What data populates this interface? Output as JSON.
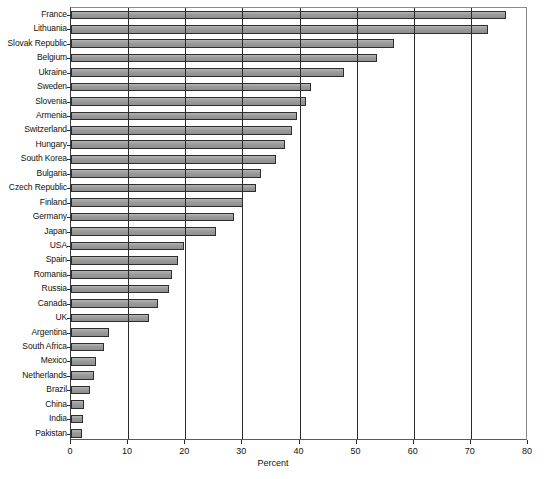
{
  "chart_data": {
    "type": "bar",
    "orientation": "horizontal",
    "title": "",
    "xlabel": "Percent",
    "ylabel": "",
    "xlim": [
      0,
      80
    ],
    "xticks": [
      0,
      10,
      20,
      30,
      40,
      50,
      60,
      70,
      80
    ],
    "grid": "vertical",
    "legend": "none",
    "bar_color": "#9c9c9c",
    "bar_edge_color": "#2e2e2e",
    "categories": [
      "France",
      "Lithuania",
      "Slovak Republic",
      "Belgium",
      "Ukraine",
      "Sweden",
      "Slovenia",
      "Armenia",
      "Switzerland",
      "Hungary",
      "South Korea",
      "Bulgaria",
      "Czech Republic",
      "Finland",
      "Germany",
      "Japan",
      "USA",
      "Spain",
      "Romania",
      "Russia",
      "Canada",
      "UK",
      "Argentina",
      "South Africa",
      "Mexico",
      "Netherlands",
      "Brazil",
      "China",
      "India",
      "Pakistan"
    ],
    "values": [
      76.2,
      73.0,
      56.6,
      53.6,
      47.8,
      42.0,
      41.2,
      39.5,
      38.6,
      37.4,
      35.8,
      33.2,
      32.4,
      30.1,
      28.5,
      25.4,
      19.8,
      18.7,
      17.7,
      17.2,
      15.2,
      13.7,
      6.7,
      5.7,
      4.4,
      4.0,
      3.4,
      2.3,
      2.1,
      2.0
    ]
  }
}
